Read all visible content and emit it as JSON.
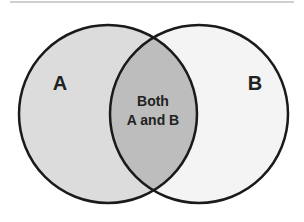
{
  "diagram": {
    "type": "venn",
    "sets": [
      {
        "label": "A",
        "fill": "#dcdcdc"
      },
      {
        "label": "B",
        "fill": "#f4f4f4"
      }
    ],
    "intersection": {
      "line1": "Both",
      "line2": "A and B",
      "fill": "#bdbdbd"
    },
    "stroke": "#1a1a1a"
  }
}
